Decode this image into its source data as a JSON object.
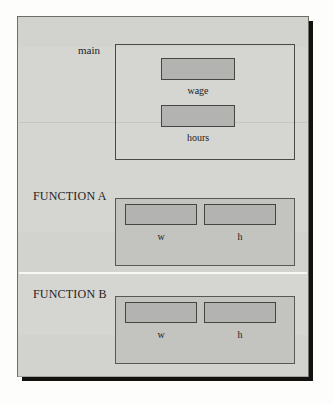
{
  "diagram": {
    "type": "variable-scope-diagram",
    "sections": [
      {
        "id": "main",
        "label": "main",
        "style": "outlined",
        "cells": [
          {
            "id": "wage",
            "label": "wage"
          },
          {
            "id": "hours",
            "label": "hours"
          }
        ]
      },
      {
        "id": "function-a",
        "label": "FUNCTION A",
        "style": "filled",
        "cells": [
          {
            "id": "a-w",
            "label": "w"
          },
          {
            "id": "a-h",
            "label": "h"
          }
        ]
      },
      {
        "id": "function-b",
        "label": "FUNCTION B",
        "style": "filled",
        "cells": [
          {
            "id": "b-w",
            "label": "w"
          },
          {
            "id": "b-h",
            "label": "h"
          }
        ]
      }
    ],
    "colors": {
      "page_background": "#d5d5d2",
      "frame_border": "#6e6e68",
      "frame_shadow": "#14120f",
      "container_fill": "#c3c3c0",
      "container_border": "#5a5854",
      "cell_fill": "#b3b3b1",
      "cell_border": "#47453f",
      "text": "#262422",
      "separator_white": "#f7f7f5",
      "separator_faint": "#c3c3c0"
    }
  }
}
